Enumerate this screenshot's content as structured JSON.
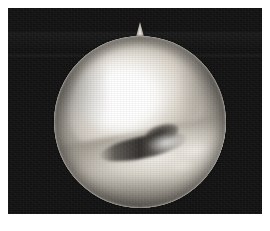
{
  "image": {
    "title": "Arthroscopic view",
    "modality": "Arthroscopy",
    "caption": "",
    "frame": {
      "background_color": "#101010",
      "left": 8,
      "top": 8,
      "width": 254,
      "height": 206
    },
    "scope_field": {
      "shape": "circle",
      "center_x": 135,
      "center_y": 114,
      "radius": 86,
      "index_marker": "triangular-notch-top",
      "rim_color": "#e2ddd4"
    },
    "structures": [
      {
        "name": "femoral-condyle",
        "description": "Large bright convex articular cartilage surface occupying the upper-left two thirds of the field",
        "tone": "#ffffff"
      },
      {
        "name": "specular-highlight",
        "description": "Saturated white light reflection near the centre-left of the condyle",
        "tone": "#ffffff"
      },
      {
        "name": "joint-space-crevice",
        "description": "Dark oblique gap separating the condyle from the tissue below",
        "tone": "#1e1c19"
      },
      {
        "name": "cartilage-defect",
        "description": "Small dark irregular depression at the mid-right margin of the condyle",
        "tone": "#1c1a17"
      },
      {
        "name": "meniscus",
        "description": "Grey fibrocartilage band sweeping across the lower half of the field",
        "tone": "#a8a298"
      },
      {
        "name": "fibrous-tissue",
        "description": "Whitish fibrillated strands on the lower-right of the field",
        "tone": "#f5f3ef"
      }
    ],
    "palette": {
      "surround": "#101010",
      "page": "#ffffff",
      "tissue_mid": "#b3ada3",
      "tissue_dark": "#8a857c",
      "tissue_light": "#ffffff"
    }
  }
}
